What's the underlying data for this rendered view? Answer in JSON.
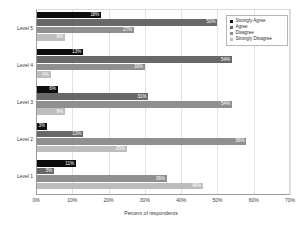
{
  "chart_data": {
    "type": "bar",
    "orientation": "horizontal",
    "title": "",
    "xlabel": "Percent of respondents",
    "ylabel": "",
    "xlim": [
      0,
      70
    ],
    "xticks": [
      "0%",
      "10%",
      "20%",
      "30%",
      "40%",
      "50%",
      "60%",
      "70%"
    ],
    "xtick_values": [
      0,
      10,
      20,
      30,
      40,
      50,
      60,
      70
    ],
    "grid": true,
    "grid_axis": "x",
    "legend_position": "top-right",
    "categories": [
      "Level 1",
      "Level 2",
      "Level 3",
      "Level 4",
      "Level 5"
    ],
    "category_order_top_to_bottom": [
      "Level 5",
      "Level 4",
      "Level 3",
      "Level 2",
      "Level 1"
    ],
    "series": [
      {
        "name": "Strongly Agree",
        "color": "#0d0d0d",
        "values": [
          11,
          3,
          6,
          13,
          18
        ],
        "labels": [
          "11%",
          "3%",
          "6%",
          "13%",
          "18%"
        ]
      },
      {
        "name": "Agree",
        "color": "#686868",
        "values": [
          5,
          13,
          31,
          54,
          50
        ],
        "labels": [
          "5%",
          "13%",
          "31%",
          "54%",
          "50%"
        ]
      },
      {
        "name": "Disagree",
        "color": "#8f8f8f",
        "values": [
          36,
          58,
          54,
          30,
          27
        ],
        "labels": [
          "36%",
          "58%",
          "54%",
          "30%",
          "27%"
        ]
      },
      {
        "name": "Strongly Disagree",
        "color": "#bdbdbd",
        "values": [
          46,
          25,
          8,
          4,
          8
        ],
        "labels": [
          "46%",
          "25%",
          "8%",
          "4%",
          "8%"
        ]
      }
    ]
  },
  "legend": {
    "items": [
      {
        "label": "Strongly Agree",
        "color": "#0d0d0d"
      },
      {
        "label": "Agree",
        "color": "#686868"
      },
      {
        "label": "Disagree",
        "color": "#8f8f8f"
      },
      {
        "label": "Strongly Disagree",
        "color": "#bdbdbd"
      }
    ]
  }
}
